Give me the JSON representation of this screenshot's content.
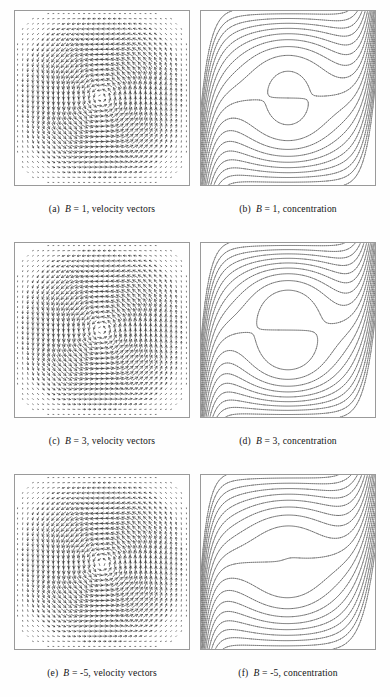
{
  "figure": {
    "layout": "3 rows x 2 columns",
    "rows": 3,
    "columns": 2
  },
  "panels": [
    {
      "tag": "(a)",
      "param_symbol": "B",
      "param_value": "1",
      "quantity": "velocity vectors",
      "caption": "(a)  B = 1, velocity vectors",
      "caption_prefix": "(a)",
      "caption_suffix": "= 1, velocity vectors",
      "type": "vector"
    },
    {
      "tag": "(b)",
      "param_symbol": "B",
      "param_value": "1",
      "quantity": "concentration",
      "caption": "(b)  B = 1, concentration",
      "caption_prefix": "(b)",
      "caption_suffix": "= 1, concentration",
      "type": "contour"
    },
    {
      "tag": "(c)",
      "param_symbol": "B",
      "param_value": "3",
      "quantity": "velocity vectors",
      "caption": "(c)  B = 3, velocity vectors",
      "caption_prefix": "(c)",
      "caption_suffix": "= 3, velocity vectors",
      "type": "vector"
    },
    {
      "tag": "(d)",
      "param_symbol": "B",
      "param_value": "3",
      "quantity": "concentration",
      "caption": "(d)  B = 3, concentration",
      "caption_prefix": "(d)",
      "caption_suffix": "= 3, concentration",
      "type": "contour"
    },
    {
      "tag": "(e)",
      "param_symbol": "B",
      "param_value": "-5",
      "quantity": "velocity vectors",
      "caption": "(e)  B = -5, velocity vectors",
      "caption_prefix": "(e)",
      "caption_suffix": "= -5, velocity vectors",
      "type": "vector"
    },
    {
      "tag": "(f)",
      "param_symbol": "B",
      "param_value": "-5",
      "quantity": "concentration",
      "caption": "(f)  B = -5, concentration",
      "caption_prefix": "(f)",
      "caption_suffix": "= -5, concentration",
      "type": "contour"
    }
  ],
  "chart_data": [
    {
      "id": "panel-a",
      "type": "scatter",
      "subtype": "vector-field",
      "title": "(a) B = 1, velocity vectors",
      "xlabel": "",
      "ylabel": "",
      "xlim": [
        0,
        1
      ],
      "ylim": [
        0,
        1
      ],
      "grid": false,
      "legend": "none",
      "domain": "unit square cavity",
      "grid_nx": 34,
      "grid_ny": 34,
      "circulation": "clockwise",
      "cell_count": 1,
      "vortex_centers": [
        [
          0.46,
          0.52
        ]
      ],
      "core_radius": 0.3,
      "strength": 1.0,
      "tilt_deg": 0,
      "boundary_jet": 0.1,
      "notes": "Single clockwise recirculation cell filling the cavity; strongest vectors along all four walls, quiescent core."
    },
    {
      "id": "panel-b",
      "type": "line",
      "subtype": "contour",
      "title": "(b) B = 1, concentration",
      "xlabel": "",
      "ylabel": "",
      "xlim": [
        0,
        1
      ],
      "ylim": [
        0,
        1
      ],
      "grid": false,
      "legend": "none",
      "n_contours": 19,
      "levels": [
        0.05,
        0.1,
        0.15,
        0.2,
        0.25,
        0.3,
        0.35,
        0.4,
        0.45,
        0.5,
        0.55,
        0.6,
        0.65,
        0.7,
        0.75,
        0.8,
        0.85,
        0.9,
        0.95
      ],
      "orientation": "horizontal-stratified",
      "s_amplitude": 0.085,
      "left_layer": 0.055,
      "right_layer": 0.055,
      "notes": "Nearly horizontal stratified contours with an S-shaped bend in the core; dense boundary layers hug both vertical walls."
    },
    {
      "id": "panel-c",
      "type": "scatter",
      "subtype": "vector-field",
      "title": "(c) B = 3, velocity vectors",
      "xlabel": "",
      "ylabel": "",
      "xlim": [
        0,
        1
      ],
      "ylim": [
        0,
        1
      ],
      "grid": false,
      "legend": "none",
      "domain": "unit square cavity",
      "grid_nx": 34,
      "grid_ny": 34,
      "circulation": "clockwise",
      "cell_count": 1,
      "vortex_centers": [
        [
          0.47,
          0.5
        ]
      ],
      "core_radius": 0.305,
      "strength": 1.22,
      "tilt_deg": 6,
      "boundary_jet": 0.085,
      "notes": "Stronger clockwise cell than B = 1; intensified wall jets and sharper corner turning."
    },
    {
      "id": "panel-d",
      "type": "line",
      "subtype": "contour",
      "title": "(d) B = 3, concentration",
      "xlabel": "",
      "ylabel": "",
      "xlim": [
        0,
        1
      ],
      "ylim": [
        0,
        1
      ],
      "grid": false,
      "legend": "none",
      "n_contours": 19,
      "levels": [
        0.05,
        0.1,
        0.15,
        0.2,
        0.25,
        0.3,
        0.35,
        0.4,
        0.45,
        0.5,
        0.55,
        0.6,
        0.65,
        0.7,
        0.75,
        0.8,
        0.85,
        0.9,
        0.95
      ],
      "orientation": "horizontal-stratified",
      "s_amplitude": 0.105,
      "left_layer": 0.05,
      "right_layer": 0.062,
      "notes": "Similar stratification to (b) with a more pronounced S bend and a thicker right-wall boundary layer."
    },
    {
      "id": "panel-e",
      "type": "scatter",
      "subtype": "vector-field",
      "title": "(e) B = -5, velocity vectors",
      "xlabel": "",
      "ylabel": "",
      "xlim": [
        0,
        1
      ],
      "ylim": [
        0,
        1
      ],
      "grid": false,
      "legend": "none",
      "domain": "unit square cavity",
      "grid_nx": 34,
      "grid_ny": 34,
      "circulation": "clockwise",
      "cell_count": 1,
      "vortex_centers": [
        [
          0.5,
          0.46
        ]
      ],
      "core_radius": 0.295,
      "strength": 1.35,
      "tilt_deg": -26,
      "boundary_jet": 0.08,
      "notes": "Negative buoyancy ratio tilts the cell along the diagonal; intense flow in the upper-right and lower-left corners."
    },
    {
      "id": "panel-f",
      "type": "line",
      "subtype": "contour",
      "title": "(f) B = -5, concentration",
      "xlabel": "",
      "ylabel": "",
      "xlim": [
        0,
        1
      ],
      "ylim": [
        0,
        1
      ],
      "grid": false,
      "legend": "none",
      "n_contours": 19,
      "levels": [
        0.05,
        0.1,
        0.15,
        0.2,
        0.25,
        0.3,
        0.35,
        0.4,
        0.45,
        0.5,
        0.55,
        0.6,
        0.65,
        0.7,
        0.75,
        0.8,
        0.85,
        0.9,
        0.95
      ],
      "orientation": "horizontal-stratified",
      "s_amplitude": 0.07,
      "left_layer": 0.045,
      "right_layer": 0.075,
      "notes": "Flatter, more horizontal contours with the steepest gradient concentrated against the right wall."
    }
  ]
}
